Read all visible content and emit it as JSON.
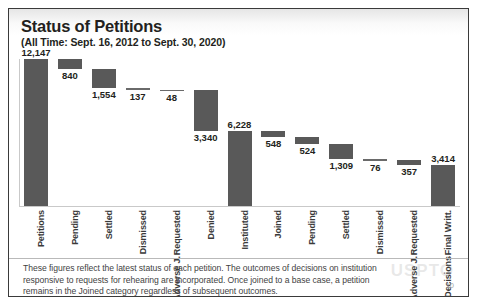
{
  "slide": {
    "title": "Status of Petitions",
    "subtitle": "(All Time: Sept. 16, 2012 to Sept. 30, 2020)",
    "footnote": "These figures reflect the latest status of each petition. The outcomes of decisions on institution responsive to requests for rehearing are incorporated. Once joined to a base case, a petition remains in the Joined category regardless of subsequent outcomes.",
    "page_number": "10",
    "watermark": "USPTO"
  },
  "colors": {
    "bar": "#595959",
    "frame": "#3a3a3a",
    "text": "#231f20",
    "axis": "#c9c9c9"
  },
  "chart_data": {
    "type": "bar",
    "subtype": "waterfall",
    "title": "Status of Petitions",
    "subtitle": "(All Time: Sept. 16, 2012 to Sept. 30, 2020)",
    "xlabel": "",
    "ylabel": "",
    "ylim": [
      0,
      12147
    ],
    "grid": false,
    "legend": false,
    "categories": [
      "Petitions",
      "Pending",
      "Settled",
      "Dismissed",
      "Requested Adverse J.",
      "Denied",
      "Instituted",
      "Joined",
      "Pending",
      "Settled",
      "Dismissed",
      "Requested Adverse J.",
      "Final Writt. Decisions"
    ],
    "category_lines": [
      [
        "Petitions"
      ],
      [
        "Pending"
      ],
      [
        "Settled"
      ],
      [
        "Dismissed"
      ],
      [
        "Requested",
        "Adverse J."
      ],
      [
        "Denied"
      ],
      [
        "Instituted"
      ],
      [
        "Joined"
      ],
      [
        "Pending"
      ],
      [
        "Settled"
      ],
      [
        "Dismissed"
      ],
      [
        "Requested",
        "Adverse J."
      ],
      [
        "Final Writt.",
        "Decisions"
      ]
    ],
    "values": [
      12147,
      840,
      1554,
      137,
      48,
      3340,
      6228,
      548,
      524,
      1309,
      76,
      357,
      3414
    ],
    "value_labels": [
      "12,147",
      "840",
      "1,554",
      "137",
      "48",
      "3,340",
      "6,228",
      "548",
      "524",
      "1,309",
      "76",
      "357",
      "3,414"
    ],
    "bars": [
      {
        "category": "Petitions",
        "value": 12147,
        "label": "12,147",
        "base": 0,
        "top": 12147,
        "label_pos": "above"
      },
      {
        "category": "Pending",
        "value": 840,
        "label": "840",
        "base": 11307,
        "top": 12147,
        "label_pos": "below"
      },
      {
        "category": "Settled",
        "value": 1554,
        "label": "1,554",
        "base": 9753,
        "top": 11307,
        "label_pos": "below"
      },
      {
        "category": "Dismissed",
        "value": 137,
        "label": "137",
        "base": 9616,
        "top": 9753,
        "label_pos": "below"
      },
      {
        "category": "Requested Adverse J.",
        "value": 48,
        "label": "48",
        "base": 9568,
        "top": 9616,
        "label_pos": "below"
      },
      {
        "category": "Denied",
        "value": 3340,
        "label": "3,340",
        "base": 6228,
        "top": 9568,
        "label_pos": "below"
      },
      {
        "category": "Instituted",
        "value": 6228,
        "label": "6,228",
        "base": 0,
        "top": 6228,
        "label_pos": "above"
      },
      {
        "category": "Joined",
        "value": 548,
        "label": "548",
        "base": 5680,
        "top": 6228,
        "label_pos": "below"
      },
      {
        "category": "Pending",
        "value": 524,
        "label": "524",
        "base": 5156,
        "top": 5680,
        "label_pos": "below"
      },
      {
        "category": "Settled",
        "value": 1309,
        "label": "1,309",
        "base": 3847,
        "top": 5156,
        "label_pos": "below"
      },
      {
        "category": "Dismissed",
        "value": 76,
        "label": "76",
        "base": 3771,
        "top": 3847,
        "label_pos": "below"
      },
      {
        "category": "Requested Adverse J.",
        "value": 357,
        "label": "357",
        "base": 3414,
        "top": 3771,
        "label_pos": "below"
      },
      {
        "category": "Final Writt. Decisions",
        "value": 3414,
        "label": "3,414",
        "base": 0,
        "top": 3414,
        "label_pos": "above"
      }
    ]
  }
}
